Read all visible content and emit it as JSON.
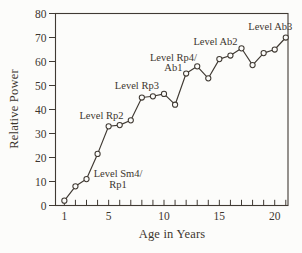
{
  "figure": {
    "background": "#fcfcfa",
    "ink_color": "#403a33",
    "text_color": "#3c362f"
  },
  "chart_data": {
    "type": "line",
    "title": "",
    "xlabel": "Age in Years",
    "ylabel": "Relative Power",
    "grid": false,
    "legend_position": "none",
    "marker": "open-circle",
    "xlim": [
      0.2,
      21.2
    ],
    "ylim": [
      0,
      80
    ],
    "x_labeled_ticks": [
      1,
      5,
      10,
      15,
      20
    ],
    "x_minor_ticks": [
      1,
      2,
      3,
      4,
      5,
      6,
      7,
      8,
      9,
      10,
      11,
      12,
      13,
      14,
      15,
      16,
      17,
      18,
      19,
      20,
      21
    ],
    "y_ticks": [
      0,
      10,
      20,
      30,
      40,
      50,
      60,
      70,
      80
    ],
    "x": [
      1,
      2,
      3,
      4,
      5,
      6,
      7,
      8,
      9,
      10,
      11,
      12,
      13,
      14,
      15,
      16,
      17,
      18,
      19,
      20,
      21
    ],
    "y": [
      2,
      8,
      11,
      21.5,
      33,
      33.5,
      35.5,
      45,
      45.5,
      46.5,
      42,
      55,
      58,
      53,
      61,
      62.5,
      65.5,
      58.5,
      63.5,
      65,
      70
    ],
    "annotations": [
      {
        "lines": [
          "Level Sm4/",
          "Rp1"
        ],
        "x": 5.85,
        "y": 13.4
      },
      {
        "lines": [
          "Level Rp2"
        ],
        "x": 4.35,
        "y": 37.6
      },
      {
        "lines": [
          "Level Rp3"
        ],
        "x": 7.55,
        "y": 50.2
      },
      {
        "lines": [
          "Level Rp4/",
          "Ab1"
        ],
        "x": 10.85,
        "y": 61.9
      },
      {
        "lines": [
          "Level Ab2"
        ],
        "x": 14.65,
        "y": 68.2
      },
      {
        "lines": [
          "Level Ab3"
        ],
        "x": 19.6,
        "y": 74.8
      }
    ]
  }
}
